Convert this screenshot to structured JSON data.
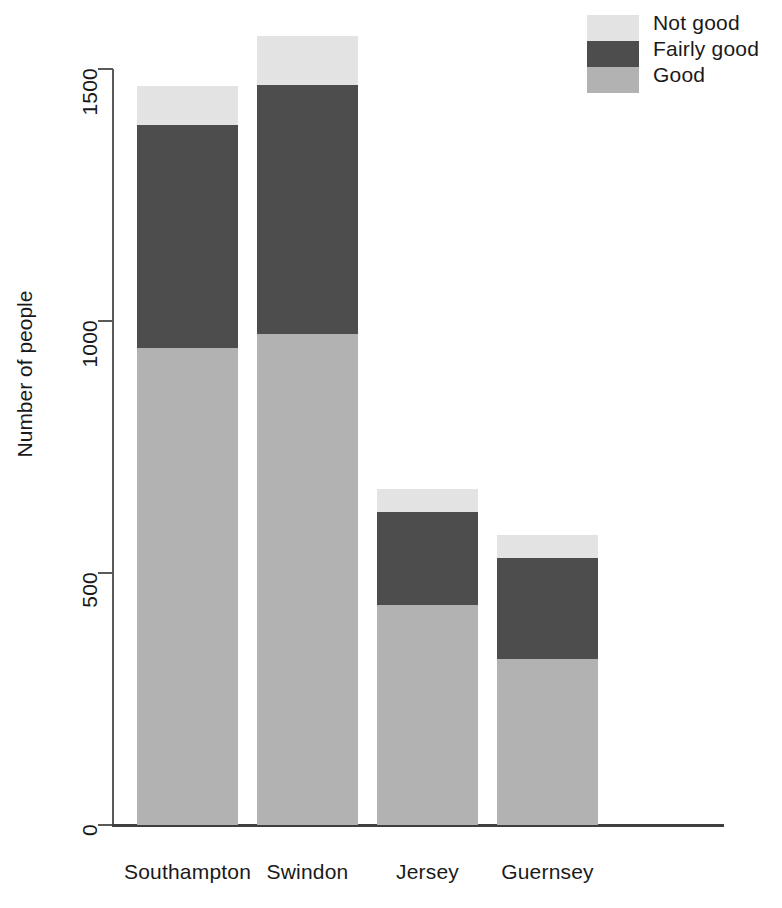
{
  "chart_data": {
    "type": "bar",
    "subtype": "stacked-vertical",
    "title": "",
    "subtitle": "",
    "xlabel": "",
    "ylabel": "Number of people",
    "categories": [
      "Southampton",
      "Swindon",
      "Jersey",
      "Guernsey"
    ],
    "series": [
      {
        "name": "Good",
        "color": "#b2b2b2",
        "values": [
          946,
          974,
          437,
          330
        ]
      },
      {
        "name": "Fairly good",
        "color": "#4d4d4d",
        "values": [
          443,
          494,
          184,
          200
        ]
      },
      {
        "name": "Not good",
        "color": "#e3e3e3",
        "values": [
          77,
          97,
          46,
          45
        ]
      }
    ],
    "stack_totals": [
      1466,
      1565,
      667,
      575
    ],
    "ylim": [
      0,
      1565
    ],
    "yticks": [
      0,
      500,
      1000,
      1500
    ],
    "ytick_labels": [
      "0",
      "500",
      "1000",
      "1500"
    ],
    "grid": false,
    "legend": {
      "position": "top-right",
      "entries": [
        {
          "label": "Not good",
          "color": "#e3e3e3"
        },
        {
          "label": "Fairly good",
          "color": "#4d4d4d"
        },
        {
          "label": "Good",
          "color": "#b2b2b2"
        }
      ]
    },
    "axis_color": "#5a5a5a",
    "background": "#ffffff"
  },
  "layout": {
    "plot": {
      "left": 114,
      "right": 724,
      "top": 20,
      "baseline": 825
    },
    "y_scale_px_per_unit": 0.504,
    "bars": [
      {
        "x": 137,
        "width": 101
      },
      {
        "x": 257,
        "width": 101
      },
      {
        "x": 377,
        "width": 101
      },
      {
        "x": 497,
        "width": 101
      }
    ]
  }
}
